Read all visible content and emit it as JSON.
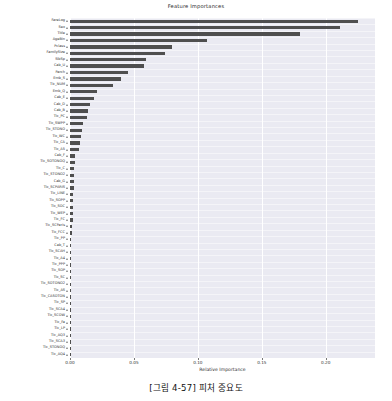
{
  "chart_data": {
    "type": "bar",
    "orientation": "horizontal",
    "title": "Feature Importances",
    "xlabel": "Relative Importance",
    "ylabel": "",
    "xlim": [
      0.0,
      0.2385
    ],
    "xticks": [
      0.0,
      0.05,
      0.1,
      0.15,
      0.2
    ],
    "xticklabels": [
      "0.00",
      "0.05",
      "0.10",
      "0.15",
      "0.20"
    ],
    "grid": "vertical",
    "legend": "none",
    "bar_color": "#4f4f4f",
    "plot_bg": "#eaeaf2",
    "categories": [
      "FareLog",
      "Sex",
      "Title",
      "AgeBin",
      "Pclass",
      "FamilySize",
      "SibSp",
      "Cab_U",
      "Parch",
      "Emb_S",
      "Tic_NUM",
      "Emb_Q",
      "Cab_E",
      "Cab_D",
      "Cab_B",
      "Tic_PC",
      "Tic_SWPP",
      "Tic_STONO",
      "Tic_WC",
      "Tic_CA",
      "Tic_A5",
      "Cab_F",
      "Tic_SOTONOQ",
      "Tic_C",
      "Tic_STONO2",
      "Cab_G",
      "Tic_SCPARIS",
      "Tic_LINE",
      "Tic_SOPP",
      "Tic_SOC",
      "Tic_WEP",
      "Tic_FC",
      "Tic_SCParis",
      "Tic_FCC",
      "Tic_PP",
      "Cab_T",
      "Tic_SCAH",
      "Tic_A4",
      "Tic_PPP",
      "Tic_SOP",
      "Tic_SC",
      "Tic_SOTONO2",
      "Tic_AS",
      "Tic_CASOTON",
      "Tic_SP",
      "Tic_SCA4",
      "Tic_SCOW",
      "Tic_Fa",
      "Tic_LP",
      "Tic_AQ3",
      "Tic_SCA3",
      "Tic_STONOQ",
      "Tic_AQ4"
    ],
    "values": [
      0.2253,
      0.211,
      0.18,
      0.107,
      0.08,
      0.074,
      0.0595,
      0.058,
      0.045,
      0.04,
      0.034,
      0.0215,
      0.0185,
      0.016,
      0.014,
      0.013,
      0.0102,
      0.0094,
      0.0086,
      0.008,
      0.0072,
      0.004,
      0.0037,
      0.0035,
      0.0033,
      0.003,
      0.0029,
      0.0027,
      0.0026,
      0.0024,
      0.0022,
      0.002,
      0.0018,
      0.0016,
      0.0009,
      0.0008,
      0.0007,
      0.0007,
      0.0006,
      0.0006,
      0.0005,
      0.0005,
      0.0004,
      0.0004,
      0.0003,
      0.0003,
      0.0003,
      0.0002,
      0.0002,
      0.0002,
      0.0001,
      0.0001,
      0.0001
    ]
  },
  "caption": {
    "text": "[그림 4-57] 피처 중요도"
  }
}
